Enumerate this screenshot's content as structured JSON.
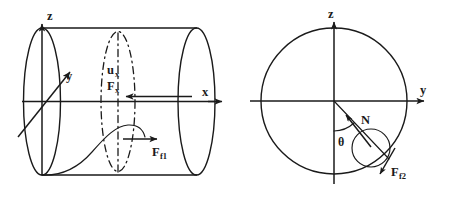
{
  "figure": {
    "domain": "Diagram",
    "background_color": "#ffffff",
    "line_color": "#1a1a1a",
    "width": 452,
    "height": 203
  },
  "panels": [
    {
      "id": "left-panel",
      "name": "cylinder-side-view",
      "description": "Side view of a horizontal cylinder drawn in perspective with two end ellipses, a dash-dot cross-section ellipse, a coordinate triad and a curved particle trajectory.",
      "axes": [
        {
          "name": "z-axis",
          "label": "z",
          "direction": "up"
        },
        {
          "name": "y-axis",
          "label": "y",
          "direction": "up-right"
        },
        {
          "name": "x-axis",
          "label": "x",
          "direction": "right"
        }
      ],
      "annotations": [
        {
          "name": "axial-velocity-label",
          "label": "u",
          "subscript": "x"
        },
        {
          "name": "axial-force-label",
          "label": "F",
          "subscript": "x"
        },
        {
          "name": "friction-force-1-label",
          "label": "F",
          "subscript": "f1"
        }
      ],
      "arrows": [
        {
          "name": "axial-force-arrow",
          "direction": "left",
          "along": "x-axis"
        },
        {
          "name": "friction-force-1-arrow",
          "direction": "right"
        }
      ]
    },
    {
      "id": "right-panel",
      "name": "cylinder-cross-section-view",
      "description": "Cross-section circle of the cylinder with z and y axes, a particle shown as a small circle on a radius, the normal force N, the angle theta from the downward vertical, and the tangential friction force.",
      "axes": [
        {
          "name": "z-axis",
          "label": "z",
          "direction": "up"
        },
        {
          "name": "y-axis",
          "label": "y",
          "direction": "right"
        }
      ],
      "annotations": [
        {
          "name": "normal-force-label",
          "label": "N"
        },
        {
          "name": "angle-theta-label",
          "label": "θ"
        },
        {
          "name": "friction-force-2-label",
          "label": "F",
          "subscript": "f2"
        }
      ],
      "arrows": [
        {
          "name": "normal-force-arrow",
          "direction": "up-left-toward-origin"
        },
        {
          "name": "friction-force-2-arrow",
          "direction": "down-right-tangential"
        }
      ]
    }
  ],
  "labels": {
    "z_left": "z",
    "y_left": "y",
    "x_left": "x",
    "u_main": "u",
    "u_sub": "x",
    "Fx_main": "F",
    "Fx_sub": "x",
    "Ff1_main": "F",
    "Ff1_sub": "f1",
    "z_right": "z",
    "y_right": "y",
    "N": "N",
    "theta": "θ",
    "Ff2_main": "F",
    "Ff2_sub": "f2"
  }
}
